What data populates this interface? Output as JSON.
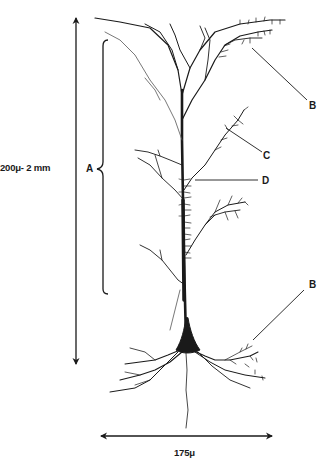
{
  "figure": {
    "ink_color": "#1a1a1a",
    "background_color": "#ffffff"
  },
  "labels": {
    "height_scale": "200μ- 2 mm",
    "width_scale": "175μ",
    "bracket_a": "A",
    "callout_b_top": "B",
    "callout_c": "C",
    "callout_d": "D",
    "callout_b_bottom": "B"
  },
  "annotations": [
    {
      "id": "A",
      "type": "bracket",
      "target": "apical dendrite region"
    },
    {
      "id": "B",
      "type": "callout",
      "target": "apical tuft dendrite branch"
    },
    {
      "id": "C",
      "type": "callout",
      "target": "oblique dendrite branch"
    },
    {
      "id": "D",
      "type": "callout",
      "target": "dendritic spines on apical shaft"
    },
    {
      "id": "B",
      "type": "callout",
      "target": "basal dendrite branch"
    }
  ],
  "dimensions": [
    {
      "axis": "vertical",
      "label": "200μ- 2 mm"
    },
    {
      "axis": "horizontal",
      "label": "175μ"
    }
  ]
}
